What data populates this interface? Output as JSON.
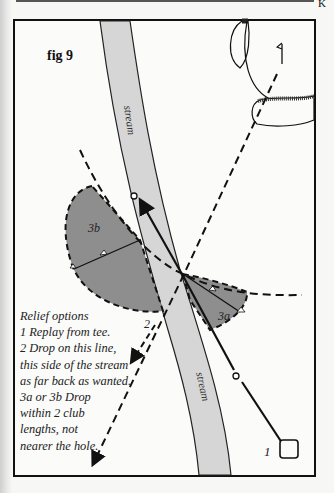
{
  "figure": {
    "label": "fig 9",
    "stream_label_top": "stream",
    "stream_label_bottom": "stream",
    "zone_3b_label": "3b",
    "zone_3a_label": "3a",
    "option_2_label": "2",
    "tee_label": "1"
  },
  "notes": {
    "title": "Relief options",
    "lines": [
      "1 Replay from tee.",
      "2 Drop on this line,",
      "this side of the stream",
      "as far back as wanted.",
      "3a or 3b Drop",
      "within 2 club",
      "lengths, not",
      "nearer the hole."
    ]
  },
  "colors": {
    "stream": "#d6d6d6",
    "relief_zone": "#8e8e8e",
    "ink": "#111111",
    "paper": "#f7f7f5"
  },
  "corner_mark": "K"
}
